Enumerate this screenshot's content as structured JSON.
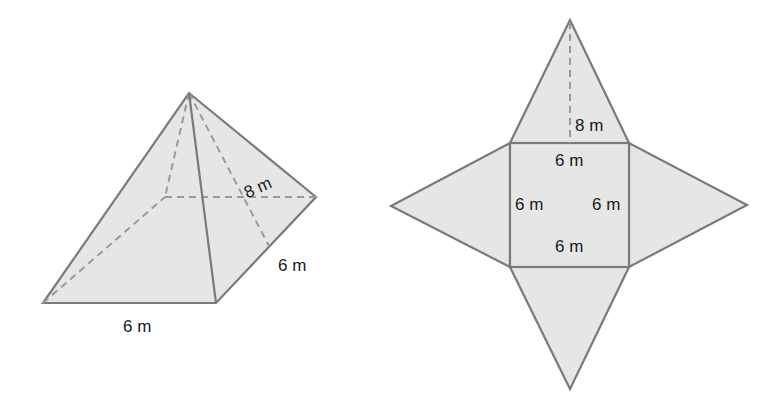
{
  "figure": {
    "pyramid": {
      "base_front_label": "6 m",
      "base_side_label": "6 m",
      "slant_height_label": "8 m"
    },
    "net": {
      "slant_height_label": "8 m",
      "square_top_label": "6 m",
      "square_left_label": "6 m",
      "square_right_label": "6 m",
      "square_bottom_label": "6 m"
    },
    "colors": {
      "fill": "#e6e6e6",
      "stroke": "#7a7a7a",
      "hidden_stroke": "#9a9a9a",
      "text": "#1a1a1a"
    }
  }
}
